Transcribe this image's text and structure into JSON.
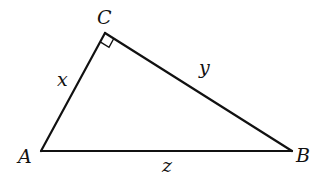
{
  "diagram": {
    "type": "right-triangle",
    "vertices": {
      "A": {
        "label": "A",
        "x": 41,
        "y": 151
      },
      "B": {
        "label": "B",
        "x": 292,
        "y": 151
      },
      "C": {
        "label": "C",
        "x": 105,
        "y": 33
      }
    },
    "sides": {
      "AC": {
        "label": "x"
      },
      "CB": {
        "label": "y"
      },
      "AB": {
        "label": "z"
      }
    },
    "right_angle_at": "C",
    "stroke_color": "#111111"
  }
}
